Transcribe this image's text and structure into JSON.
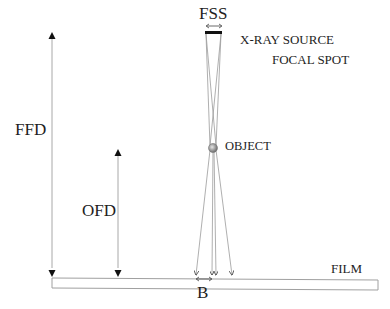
{
  "diagram": {
    "labels": {
      "fss": "FSS",
      "source_line1": "X-RAY SOURCE",
      "source_line2": "FOCAL SPOT",
      "object": "OBJECT",
      "ffd": "FFD",
      "ofd": "OFD",
      "film": "FILM",
      "blur": "B"
    },
    "elements": [
      {
        "name": "focal-spot",
        "type": "bar"
      },
      {
        "name": "object",
        "type": "sphere"
      },
      {
        "name": "film",
        "type": "rectangle"
      },
      {
        "name": "ffd-dimension",
        "type": "arrow",
        "meaning": "Focus-to-Film Distance"
      },
      {
        "name": "ofd-dimension",
        "type": "arrow",
        "meaning": "Object-to-Film Distance"
      },
      {
        "name": "fss-dimension",
        "type": "double-arrow",
        "meaning": "Focal Spot Size"
      },
      {
        "name": "blur-dimension",
        "type": "double-arrow",
        "meaning": "Geometric unsharpness (blur)"
      }
    ],
    "colors": {
      "lines": "#9a9a9a",
      "arrows": "#111111",
      "focal_spot": "#111111",
      "object": "#8c8c8c",
      "text": "#1e1e1e"
    }
  }
}
